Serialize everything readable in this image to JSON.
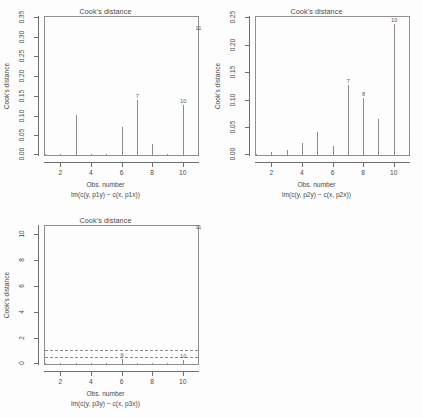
{
  "figure": {
    "panels": 4,
    "background": "#fdfdfd",
    "line_color": "#8a8a8a",
    "axis_color": "#6f6f6f",
    "text_color": "#4a4a4a"
  },
  "chart_data": [
    {
      "type": "bar",
      "panel": "top-left",
      "title": "Cook's distance",
      "xlabel": "Obs. number",
      "sublabel": "lm(c(y, p1y) ~ c(x, p1x))",
      "ylabel": "Cook's distance",
      "grid": false,
      "legend": null,
      "xlim": [
        1,
        11
      ],
      "ylim": [
        0.0,
        0.35
      ],
      "xticks": [
        2,
        4,
        6,
        8,
        10
      ],
      "xticklabels": [
        "2",
        "4",
        "6",
        "8",
        "10"
      ],
      "yticks": [
        0.0,
        0.05,
        0.1,
        0.15,
        0.2,
        0.25,
        0.3,
        0.35
      ],
      "yticklabels": [
        "0.00",
        "0.05",
        "0.10",
        "0.15",
        "0.20",
        "0.25",
        "0.30",
        "0.35"
      ],
      "x": [
        1,
        2,
        3,
        4,
        5,
        6,
        7,
        8,
        9,
        10,
        11
      ],
      "values": [
        0.002,
        0.0005,
        0.102,
        0.001,
        0.001,
        0.072,
        0.139,
        0.029,
        0.002,
        0.128,
        0.312
      ],
      "annotations": [
        {
          "label": "11",
          "x": 11,
          "y": 0.312
        },
        {
          "label": "7",
          "x": 7,
          "y": 0.139
        },
        {
          "label": "10",
          "x": 10,
          "y": 0.128
        }
      ]
    },
    {
      "type": "bar",
      "panel": "top-right",
      "title": "Cook's distance",
      "xlabel": "Obs. number",
      "sublabel": "lm(c(y, p2y) ~ c(x, p2x))",
      "ylabel": "Cook's distance",
      "grid": false,
      "legend": null,
      "xlim": [
        1,
        11
      ],
      "ylim": [
        0.0,
        0.25
      ],
      "xticks": [
        2,
        4,
        6,
        8,
        10
      ],
      "xticklabels": [
        "2",
        "4",
        "6",
        "8",
        "10"
      ],
      "yticks": [
        0.0,
        0.05,
        0.1,
        0.15,
        0.2,
        0.25
      ],
      "yticklabels": [
        "0.00",
        "0.05",
        "0.10",
        "0.15",
        "0.20",
        "0.25"
      ],
      "x": [
        1,
        2,
        3,
        4,
        5,
        6,
        7,
        8,
        9,
        10,
        11
      ],
      "values": [
        0.001,
        0.006,
        0.009,
        0.022,
        0.042,
        0.016,
        0.127,
        0.104,
        0.066,
        0.238,
        0.038
      ],
      "annotations": [
        {
          "label": "10",
          "x": 10,
          "y": 0.238
        },
        {
          "label": "7",
          "x": 7,
          "y": 0.127
        },
        {
          "label": "8",
          "x": 8,
          "y": 0.104
        }
      ]
    },
    {
      "type": "bar",
      "panel": "bottom-left",
      "title": "Cook's distance",
      "xlabel": "Obs. number",
      "sublabel": "lm(c(y, p3y) ~ c(x, p3x))",
      "ylabel": "Cook's distance",
      "grid": false,
      "legend": null,
      "xlim": [
        1,
        11
      ],
      "ylim": [
        0,
        10.6
      ],
      "xticks": [
        2,
        4,
        6,
        8,
        10
      ],
      "xticklabels": [
        "2",
        "4",
        "6",
        "8",
        "10"
      ],
      "yticks": [
        0,
        2,
        4,
        6,
        8,
        10
      ],
      "yticklabels": [
        "0",
        "2",
        "4",
        "6",
        "8",
        "10"
      ],
      "x": [
        1,
        2,
        3,
        4,
        5,
        6,
        7,
        8,
        9,
        10,
        11
      ],
      "values": [
        0.01,
        0.01,
        0.01,
        0.01,
        0.01,
        0.35,
        0.02,
        0.02,
        0.03,
        0.3,
        10.2
      ],
      "hlines": [
        {
          "y": 1.0,
          "style": "dashed"
        },
        {
          "y": 0.5,
          "style": "dashed"
        }
      ],
      "annotations": [
        {
          "label": "11",
          "x": 11,
          "y": 10.2
        },
        {
          "label": "6",
          "x": 6,
          "y": 0.35
        },
        {
          "label": "10",
          "x": 10,
          "y": 0.3
        }
      ]
    }
  ]
}
